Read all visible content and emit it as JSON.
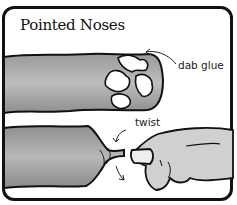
{
  "title": "Pointed Noses",
  "labels": {
    "dab_glue": "dab glue",
    "twist": "twist"
  },
  "colors": {
    "border": "#111111",
    "tube_fill": "#a9a9a9",
    "glue_fill": "#ffffff",
    "hand_fill": "#cfcfcf"
  },
  "illustrations": [
    {
      "name": "tube-with-glue",
      "caption": "dab glue"
    },
    {
      "name": "hand-twisting-tube",
      "caption": "twist"
    }
  ]
}
